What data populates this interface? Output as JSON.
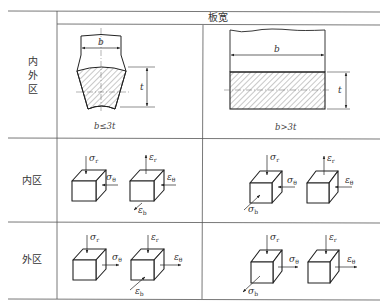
{
  "header": {
    "column_group_label": "板宽"
  },
  "rows": [
    {
      "label_lines": [
        "内",
        "外",
        "区"
      ],
      "name": "inner-outer-zone"
    },
    {
      "label": "内区",
      "name": "inner-zone"
    },
    {
      "label": "外区",
      "name": "outer-zone"
    }
  ],
  "columns": [
    {
      "condition": "b≤3t",
      "name": "narrow"
    },
    {
      "condition": "b>3t",
      "name": "wide"
    }
  ],
  "dimension_labels": {
    "width": "b",
    "thickness": "t"
  },
  "symbols": {
    "sigma_r": "σ",
    "sigma_r_sub": "r",
    "sigma_theta": "σ",
    "sigma_theta_sub": "θ",
    "sigma_b": "σ",
    "sigma_b_sub": "b",
    "eps_r": "ε",
    "eps_r_sub": "r",
    "eps_theta": "ε",
    "eps_theta_sub": "θ",
    "eps_b": "ε",
    "eps_b_sub": "b"
  },
  "colors": {
    "line": "#555555",
    "ink": "#222222",
    "hatch": "#444444"
  }
}
